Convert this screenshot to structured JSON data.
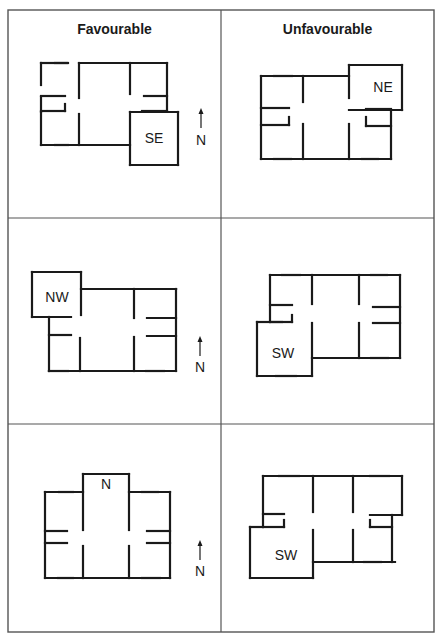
{
  "figure": {
    "headings": {
      "favourable": "Favourable",
      "unfavourable": "Unfavourable"
    },
    "colors": {
      "ink": "#1a1a1a",
      "grid": "#555555",
      "background": "#ffffff"
    },
    "grid": {
      "left": 8,
      "top": 10,
      "right": 434,
      "bottom": 632,
      "col_split": 221,
      "row_splits": [
        218,
        424
      ]
    },
    "north_label": "N",
    "panels": [
      {
        "id": "favourable-se",
        "column": "Favourable",
        "extension": "SE",
        "label": {
          "text": "SE",
          "x": 154,
          "y": 143
        },
        "arrow": {
          "x": 201,
          "y1": 108,
          "y2": 128,
          "label_y": 145
        },
        "walls": [
          [
            41,
            63,
            67,
            63
          ],
          [
            55,
            63,
            68,
            63
          ],
          [
            79,
            63,
            130,
            63
          ],
          [
            130,
            63,
            167,
            63
          ],
          [
            41,
            63,
            41,
            85
          ],
          [
            41,
            97,
            41,
            112
          ],
          [
            41,
            112,
            41,
            145
          ],
          [
            41,
            96,
            65,
            96
          ],
          [
            41,
            111,
            65,
            111
          ],
          [
            65,
            104,
            65,
            111
          ],
          [
            79,
            63,
            79,
            98
          ],
          [
            79,
            114,
            79,
            145
          ],
          [
            130,
            63,
            130,
            94
          ],
          [
            130,
            112,
            130,
            165
          ],
          [
            144,
            96,
            167,
            96
          ],
          [
            142,
            111,
            167,
            111
          ],
          [
            167,
            63,
            167,
            111
          ],
          [
            130,
            112,
            178,
            112
          ],
          [
            178,
            112,
            178,
            165
          ],
          [
            130,
            165,
            178,
            165
          ],
          [
            41,
            145,
            130,
            145
          ],
          [
            55,
            145,
            68,
            145
          ]
        ]
      },
      {
        "id": "unfavourable-ne",
        "column": "Unfavourable",
        "extension": "NE",
        "label": {
          "text": "NE",
          "x": 383,
          "y": 92
        },
        "arrow": null,
        "walls": [
          [
            261,
            76,
            349,
            76
          ],
          [
            274,
            76,
            292,
            76
          ],
          [
            349,
            65,
            402,
            65
          ],
          [
            402,
            65,
            402,
            110
          ],
          [
            349,
            110,
            402,
            110
          ],
          [
            349,
            65,
            349,
            98
          ],
          [
            261,
            76,
            261,
            159
          ],
          [
            261,
            108,
            289,
            108
          ],
          [
            261,
            125,
            289,
            125
          ],
          [
            289,
            117,
            289,
            125
          ],
          [
            303,
            76,
            303,
            102
          ],
          [
            303,
            124,
            303,
            159
          ],
          [
            349,
            124,
            349,
            159
          ],
          [
            366,
            109,
            391,
            109
          ],
          [
            366,
            126,
            391,
            126
          ],
          [
            366,
            117,
            366,
            126
          ],
          [
            391,
            110,
            391,
            159
          ],
          [
            261,
            159,
            391,
            159
          ],
          [
            274,
            159,
            291,
            159
          ],
          [
            362,
            159,
            378,
            159
          ]
        ]
      },
      {
        "id": "favourable-nw",
        "column": "Favourable",
        "extension": "NW",
        "label": {
          "text": "NW",
          "x": 57,
          "y": 302
        },
        "arrow": {
          "x": 200,
          "y1": 336,
          "y2": 356,
          "label_y": 372
        },
        "walls": [
          [
            32,
            272,
            81,
            272
          ],
          [
            32,
            272,
            32,
            317
          ],
          [
            32,
            317,
            71,
            317
          ],
          [
            81,
            272,
            81,
            315
          ],
          [
            81,
            289,
            176,
            289
          ],
          [
            134,
            289,
            176,
            289
          ],
          [
            49,
            317,
            49,
            371
          ],
          [
            49,
            335,
            71,
            335
          ],
          [
            80,
            338,
            80,
            371
          ],
          [
            134,
            289,
            134,
            318
          ],
          [
            134,
            337,
            134,
            371
          ],
          [
            147,
            318,
            176,
            318
          ],
          [
            147,
            336,
            176,
            336
          ],
          [
            176,
            289,
            176,
            371
          ],
          [
            49,
            371,
            176,
            371
          ],
          [
            49,
            371,
            68,
            371
          ],
          [
            146,
            371,
            164,
            371
          ]
        ]
      },
      {
        "id": "unfavourable-sw",
        "column": "Unfavourable",
        "extension": "SW",
        "label": {
          "text": "SW",
          "x": 283,
          "y": 358
        },
        "arrow": null,
        "walls": [
          [
            270,
            275,
            400,
            275
          ],
          [
            282,
            275,
            300,
            275
          ],
          [
            371,
            275,
            387,
            275
          ],
          [
            270,
            275,
            270,
            322
          ],
          [
            270,
            305,
            292,
            305
          ],
          [
            292,
            315,
            292,
            322
          ],
          [
            270,
            322,
            292,
            322
          ],
          [
            257,
            322,
            282,
            322
          ],
          [
            257,
            322,
            257,
            376
          ],
          [
            257,
            376,
            312,
            376
          ],
          [
            276,
            376,
            296,
            376
          ],
          [
            312,
            275,
            312,
            304
          ],
          [
            312,
            323,
            312,
            376
          ],
          [
            312,
            358,
            400,
            358
          ],
          [
            359,
            275,
            359,
            304
          ],
          [
            359,
            323,
            359,
            358
          ],
          [
            373,
            307,
            400,
            307
          ],
          [
            373,
            323,
            400,
            323
          ],
          [
            400,
            275,
            400,
            358
          ],
          [
            371,
            358,
            388,
            358
          ]
        ]
      },
      {
        "id": "favourable-n",
        "column": "Favourable",
        "extension": "N",
        "label": {
          "text": "N",
          "x": 106,
          "y": 489
        },
        "arrow": {
          "x": 200,
          "y1": 540,
          "y2": 560,
          "label_y": 576
        },
        "walls": [
          [
            83,
            474,
            129,
            474
          ],
          [
            83,
            474,
            83,
            530
          ],
          [
            129,
            474,
            129,
            530
          ],
          [
            45,
            492,
            83,
            492
          ],
          [
            59,
            492,
            73,
            492
          ],
          [
            129,
            492,
            170,
            492
          ],
          [
            142,
            492,
            158,
            492
          ],
          [
            45,
            492,
            45,
            578
          ],
          [
            45,
            531,
            67,
            531
          ],
          [
            45,
            543,
            67,
            543
          ],
          [
            83,
            546,
            83,
            578
          ],
          [
            129,
            546,
            129,
            578
          ],
          [
            147,
            531,
            170,
            531
          ],
          [
            147,
            543,
            170,
            543
          ],
          [
            170,
            492,
            170,
            578
          ],
          [
            45,
            578,
            170,
            578
          ],
          [
            58,
            578,
            73,
            578
          ],
          [
            142,
            578,
            160,
            578
          ]
        ]
      },
      {
        "id": "unfavourable-sw-2",
        "column": "Unfavourable",
        "extension": "SW",
        "label": {
          "text": "SW",
          "x": 286,
          "y": 560
        },
        "arrow": null,
        "walls": [
          [
            263,
            476,
            402,
            476
          ],
          [
            279,
            476,
            299,
            476
          ],
          [
            370,
            476,
            389,
            476
          ],
          [
            263,
            476,
            263,
            527
          ],
          [
            263,
            514,
            284,
            514
          ],
          [
            284,
            520,
            284,
            527
          ],
          [
            263,
            527,
            284,
            527
          ],
          [
            250,
            527,
            263,
            527
          ],
          [
            250,
            527,
            250,
            578
          ],
          [
            250,
            578,
            313,
            578
          ],
          [
            313,
            530,
            313,
            578
          ],
          [
            313,
            476,
            313,
            512
          ],
          [
            313,
            562,
            395,
            562
          ],
          [
            364,
            562,
            381,
            562
          ],
          [
            353,
            476,
            353,
            512
          ],
          [
            353,
            530,
            353,
            562
          ],
          [
            402,
            476,
            402,
            515
          ],
          [
            370,
            515,
            402,
            515
          ],
          [
            370,
            520,
            370,
            527
          ],
          [
            370,
            527,
            392,
            527
          ],
          [
            392,
            515,
            392,
            562
          ]
        ]
      }
    ]
  }
}
